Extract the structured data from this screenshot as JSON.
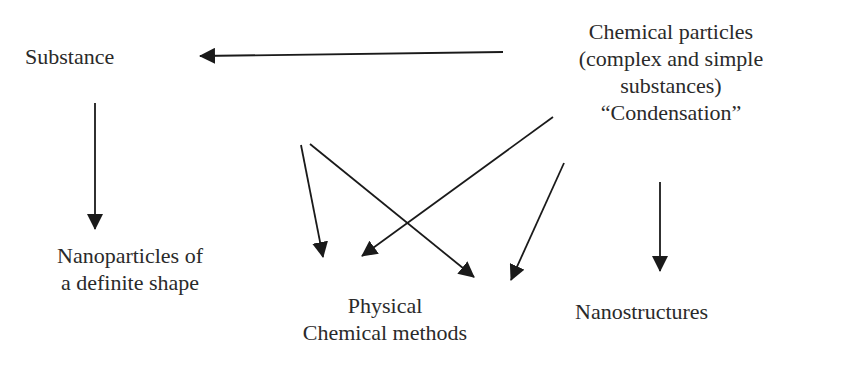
{
  "diagram": {
    "nodes": {
      "substance": {
        "lines": [
          "Substance"
        ]
      },
      "chemical_particles": {
        "lines": [
          "Chemical particles",
          "(complex and simple",
          "substances)",
          "“Condensation”"
        ]
      },
      "nanoparticles": {
        "lines": [
          "Nanoparticles of",
          "a definite shape"
        ]
      },
      "methods": {
        "lines": [
          "Physical",
          "Chemical methods"
        ]
      },
      "nanostructures": {
        "lines": [
          "Nanostructures"
        ]
      }
    },
    "edges": [
      {
        "from": "chemical_particles",
        "to": "substance"
      },
      {
        "from": "substance",
        "to": "nanoparticles"
      },
      {
        "from": "substance",
        "to": "methods"
      },
      {
        "from": "substance",
        "to": "methods"
      },
      {
        "from": "chemical_particles",
        "to": "methods"
      },
      {
        "from": "chemical_particles",
        "to": "methods"
      },
      {
        "from": "chemical_particles",
        "to": "nanostructures"
      }
    ],
    "colors": {
      "line": "#1a1a1a",
      "text": "#2a2a2a",
      "background": "#ffffff"
    }
  }
}
